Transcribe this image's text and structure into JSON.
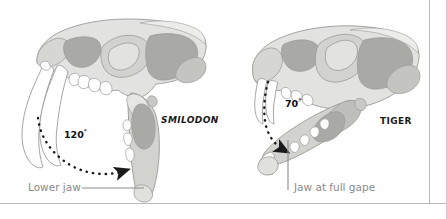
{
  "figure": {
    "title_alt": "Comparison of jaw gape between Smilodon and Tiger",
    "background_color": "#ffffff",
    "border_color": "#b9b9b9"
  },
  "palette": {
    "bone_light": "#e2e2e0",
    "bone_mid": "#d2d2cf",
    "bone_dark": "#a9a9a6",
    "bone_shadow": "#bdbdba",
    "outline": "#9a9a97",
    "tooth_white": "#fdfdfd",
    "arrow_black": "#1a1a1a",
    "leader_gray": "#8a8a8a",
    "text_dark": "#1a1a1a",
    "text_gray": "#8a8a8a"
  },
  "left_panel": {
    "species_name": "SMILODON",
    "angle_value": "120",
    "angle_degree_symbol": "°",
    "caption": "Lower jaw"
  },
  "right_panel": {
    "species_name": "TIGER",
    "angle_value": "70",
    "angle_degree_symbol": "°",
    "caption": "Jaw at full gape"
  },
  "icons": {
    "left_arrow": "dotted-curved-arrow-icon",
    "right_arrow": "dotted-curved-arrow-icon",
    "left_leader": "leader-line-icon",
    "right_leader": "leader-line-icon"
  }
}
